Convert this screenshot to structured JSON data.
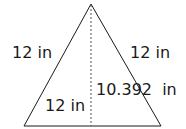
{
  "diagram": {
    "shape": "isosceles-triangle",
    "labels": {
      "left_side": "12 in",
      "right_side": "12 in",
      "base_half": "12 in",
      "height": "10.392  in"
    },
    "colors": {
      "stroke": "#1a1a1a",
      "height_line": "#555555",
      "background": "#ffffff"
    }
  }
}
